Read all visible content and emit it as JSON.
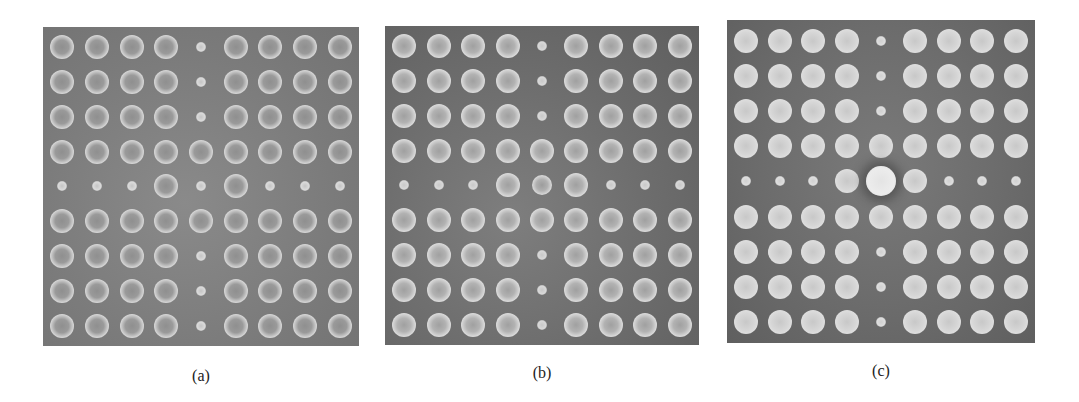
{
  "figure": {
    "legend": {
      "L": "standard rod",
      "s": "reduced-radius defect rod",
      "m": "slightly reduced center rod",
      "X": "enlarged center rod"
    },
    "panels": [
      {
        "id": "a",
        "caption": "(a)",
        "grid_size": [
          9,
          9
        ],
        "grid": [
          "LLLLsLLLL",
          "LLLLsLLLL",
          "LLLLsLLLL",
          "LLLLLLLLL",
          "sssLsLsss",
          "LLLLLLLLL",
          "LLLLsLLLL",
          "LLLLsLLLL",
          "LLLLsLLLL"
        ]
      },
      {
        "id": "b",
        "caption": "(b)",
        "grid_size": [
          9,
          9
        ],
        "grid": [
          "LLLLsLLLL",
          "LLLLsLLLL",
          "LLLLsLLLL",
          "LLLLLLLLL",
          "sssLmLsss",
          "LLLLLLLLL",
          "LLLLsLLLL",
          "LLLLsLLLL",
          "LLLLsLLLL"
        ]
      },
      {
        "id": "c",
        "caption": "(c)",
        "grid_size": [
          9,
          9
        ],
        "grid": [
          "LLLLsLLLL",
          "LLLLsLLLL",
          "LLLLsLLLL",
          "LLLLLLLLL",
          "sssLXLsss",
          "LLLLLLLLL",
          "LLLLsLLLL",
          "LLLLsLLLL",
          "LLLLsLLLL"
        ]
      }
    ]
  }
}
